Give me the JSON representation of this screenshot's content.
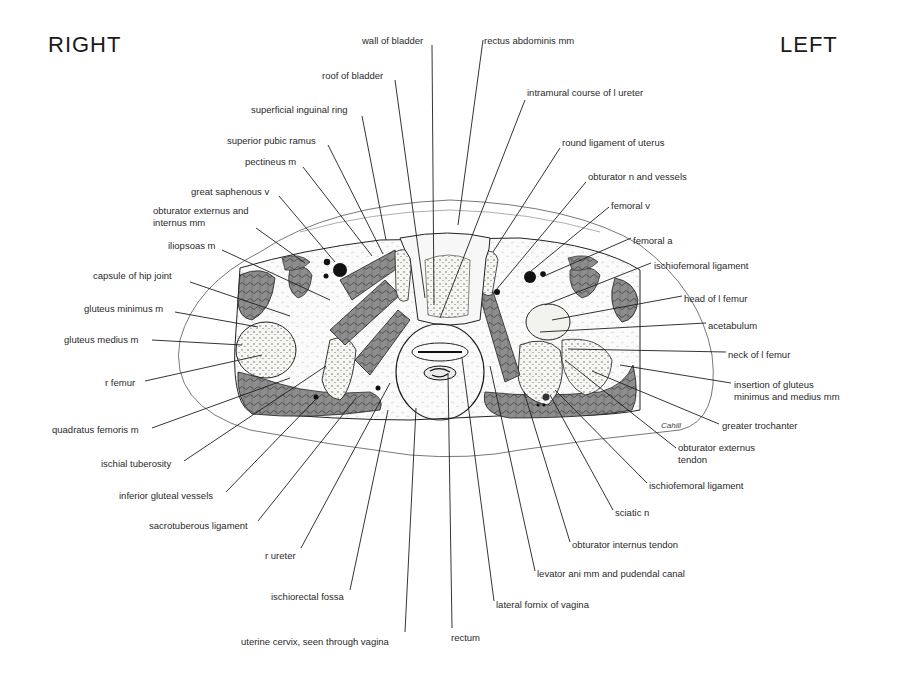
{
  "header": {
    "right_label": "RIGHT",
    "left_label": "LEFT"
  },
  "signature": "Cahill",
  "labels_top": [
    {
      "id": "wall-of-bladder",
      "text": "wall of bladder",
      "x": 362,
      "y": 35
    },
    {
      "id": "rectus-abdominis-mm",
      "text": "rectus abdominis mm",
      "x": 484,
      "y": 35
    },
    {
      "id": "roof-of-bladder",
      "text": "roof of bladder",
      "x": 322,
      "y": 70
    },
    {
      "id": "intramural-course-of-l-ureter",
      "text": "intramural course of l ureter",
      "x": 527,
      "y": 87
    },
    {
      "id": "superficial-inguinal-ring",
      "text": "superficial inguinal ring",
      "x": 251,
      "y": 104
    },
    {
      "id": "round-ligament-of-uterus",
      "text": "round ligament of uterus",
      "x": 562,
      "y": 137
    },
    {
      "id": "superior-pubic-ramus",
      "text": "superior pubic ramus",
      "x": 227,
      "y": 135
    },
    {
      "id": "pectineus-m",
      "text": "pectineus m",
      "x": 245,
      "y": 156
    },
    {
      "id": "obturator-n-and-vessels",
      "text": "obturator n and vessels",
      "x": 588,
      "y": 171
    },
    {
      "id": "great-saphenous-v",
      "text": "great saphenous v",
      "x": 191,
      "y": 186
    },
    {
      "id": "femoral-v",
      "text": "femoral v",
      "x": 611,
      "y": 200
    },
    {
      "id": "obturator-externus-and-internus-mm",
      "text": "obturator externus and\ninternus mm",
      "x": 153,
      "y": 205
    }
  ],
  "labels_left": [
    {
      "id": "iliopsoas-m",
      "text": "iliopsoas m",
      "x": 168,
      "y": 240
    },
    {
      "id": "capsule-of-hip-joint",
      "text": "capsule of hip joint",
      "x": 93,
      "y": 270
    },
    {
      "id": "gluteus-minimus-m",
      "text": "gluteus minimus m",
      "x": 84,
      "y": 303
    },
    {
      "id": "gluteus-medius-m",
      "text": "gluteus medius m",
      "x": 64,
      "y": 334
    },
    {
      "id": "r-femur",
      "text": "r femur",
      "x": 105,
      "y": 377
    },
    {
      "id": "quadratus-femoris-m",
      "text": "quadratus femoris m",
      "x": 52,
      "y": 424
    },
    {
      "id": "ischial-tuberosity",
      "text": "ischial tuberosity",
      "x": 101,
      "y": 458
    },
    {
      "id": "inferior-gluteal-vessels",
      "text": "inferior gluteal vessels",
      "x": 119,
      "y": 490
    },
    {
      "id": "sacrotuberous-ligament",
      "text": "sacrotuberous ligament",
      "x": 149,
      "y": 520
    },
    {
      "id": "r-ureter",
      "text": "r ureter",
      "x": 265,
      "y": 550
    },
    {
      "id": "ischiorectal-fossa",
      "text": "ischiorectal fossa",
      "x": 271,
      "y": 591
    },
    {
      "id": "uterine-cervix-seen-through-vagina",
      "text": "uterine cervix, seen through vagina",
      "x": 241,
      "y": 636
    }
  ],
  "labels_right": [
    {
      "id": "femoral-a",
      "text": "femoral a",
      "x": 633,
      "y": 235
    },
    {
      "id": "ischiofemoral-ligament-upper",
      "text": "ischiofemoral ligament",
      "x": 654,
      "y": 260
    },
    {
      "id": "head-of-l-femur",
      "text": "head of l femur",
      "x": 684,
      "y": 293
    },
    {
      "id": "acetabulum",
      "text": "acetabulum",
      "x": 708,
      "y": 320
    },
    {
      "id": "neck-of-l-femur",
      "text": "neck of l femur",
      "x": 728,
      "y": 349
    },
    {
      "id": "insertion-of-gluteus-minimus-and-medius-mm",
      "text": "insertion of gluteus\nminimus and medius mm",
      "x": 734,
      "y": 379
    },
    {
      "id": "greater-trochanter",
      "text": "greater trochanter",
      "x": 722,
      "y": 420
    },
    {
      "id": "obturator-externus-tendon",
      "text": "obturator externus\ntendon",
      "x": 678,
      "y": 442
    },
    {
      "id": "ischiofemoral-ligament-lower",
      "text": "ischiofemoral ligament",
      "x": 649,
      "y": 480
    },
    {
      "id": "sciatic-n",
      "text": "sciatic n",
      "x": 615,
      "y": 507
    },
    {
      "id": "obturator-internus-tendon",
      "text": "obturator internus tendon",
      "x": 572,
      "y": 539
    },
    {
      "id": "levator-ani-mm-and-pudendal-canal",
      "text": "levator ani mm and pudendal canal",
      "x": 537,
      "y": 568
    },
    {
      "id": "lateral-fornix-of-vagina",
      "text": "lateral fornix of vagina",
      "x": 496,
      "y": 599
    },
    {
      "id": "rectum",
      "text": "rectum",
      "x": 451,
      "y": 632
    }
  ],
  "colors": {
    "muscle": "#8a8a8a",
    "bone": "#f4f4f2",
    "vessel": "#111111",
    "line": "#1e1e1e"
  }
}
